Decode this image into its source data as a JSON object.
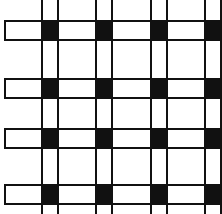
{
  "figure": {
    "width": 222,
    "height": 214,
    "background_color": "#ffffff",
    "stroke_color": "#111111",
    "fill_color": "#111111",
    "band_fill": "#ffffff",
    "stroke_width": 2
  },
  "chart_data": {
    "type": "heatmap",
    "xlabel": "",
    "ylabel": "",
    "grid": true,
    "legend_position": "none",
    "columns": [
      "V1",
      "V2",
      "V3",
      "V4"
    ],
    "rows": [
      "H1",
      "H2",
      "H3",
      "H4"
    ],
    "cell_values": [
      [
        1,
        1,
        1,
        1
      ],
      [
        1,
        1,
        1,
        1
      ],
      [
        1,
        1,
        1,
        1
      ],
      [
        1,
        1,
        1,
        1
      ]
    ],
    "value_legend": {
      "1": "black intersection square",
      "0": "white cell"
    },
    "horizontal_bands": [
      {
        "name": "H1",
        "x": 4,
        "y": 20,
        "width": 218,
        "height": 21,
        "clipped_right": true
      },
      {
        "name": "H2",
        "x": 4,
        "y": 78,
        "width": 218,
        "height": 21,
        "clipped_right": true
      },
      {
        "name": "H3",
        "x": 4,
        "y": 128,
        "width": 218,
        "height": 21,
        "clipped_right": true
      },
      {
        "name": "H4",
        "x": 4,
        "y": 184,
        "width": 218,
        "height": 21,
        "clipped_right": true
      }
    ],
    "vertical_strips": [
      {
        "name": "V1",
        "x": 41,
        "y": 0,
        "width": 18,
        "height": 214,
        "clipped_top": true,
        "clipped_bottom": true
      },
      {
        "name": "V2",
        "x": 95,
        "y": 0,
        "width": 18,
        "height": 214,
        "clipped_top": true,
        "clipped_bottom": true
      },
      {
        "name": "V3",
        "x": 150,
        "y": 0,
        "width": 18,
        "height": 214,
        "clipped_top": true,
        "clipped_bottom": true
      },
      {
        "name": "V4",
        "x": 204,
        "y": 0,
        "width": 18,
        "height": 214,
        "clipped_top": true,
        "clipped_bottom": true
      }
    ],
    "intersections": [
      {
        "row": "H1",
        "col": "V1",
        "x": 41,
        "y": 20,
        "width": 18,
        "height": 21,
        "color": "#111111"
      },
      {
        "row": "H1",
        "col": "V2",
        "x": 95,
        "y": 20,
        "width": 18,
        "height": 21,
        "color": "#111111"
      },
      {
        "row": "H1",
        "col": "V3",
        "x": 150,
        "y": 20,
        "width": 18,
        "height": 21,
        "color": "#111111"
      },
      {
        "row": "H1",
        "col": "V4",
        "x": 204,
        "y": 20,
        "width": 18,
        "height": 21,
        "color": "#111111"
      },
      {
        "row": "H2",
        "col": "V1",
        "x": 41,
        "y": 78,
        "width": 18,
        "height": 21,
        "color": "#111111"
      },
      {
        "row": "H2",
        "col": "V2",
        "x": 95,
        "y": 78,
        "width": 18,
        "height": 21,
        "color": "#111111"
      },
      {
        "row": "H2",
        "col": "V3",
        "x": 150,
        "y": 78,
        "width": 18,
        "height": 21,
        "color": "#111111"
      },
      {
        "row": "H2",
        "col": "V4",
        "x": 204,
        "y": 78,
        "width": 18,
        "height": 21,
        "color": "#111111"
      },
      {
        "row": "H3",
        "col": "V1",
        "x": 41,
        "y": 128,
        "width": 18,
        "height": 21,
        "color": "#111111"
      },
      {
        "row": "H3",
        "col": "V2",
        "x": 95,
        "y": 128,
        "width": 18,
        "height": 21,
        "color": "#111111"
      },
      {
        "row": "H3",
        "col": "V3",
        "x": 150,
        "y": 128,
        "width": 18,
        "height": 21,
        "color": "#111111"
      },
      {
        "row": "H3",
        "col": "V4",
        "x": 204,
        "y": 128,
        "width": 18,
        "height": 21,
        "color": "#111111"
      },
      {
        "row": "H4",
        "col": "V1",
        "x": 41,
        "y": 184,
        "width": 18,
        "height": 21,
        "color": "#111111"
      },
      {
        "row": "H4",
        "col": "V2",
        "x": 95,
        "y": 184,
        "width": 18,
        "height": 21,
        "color": "#111111"
      },
      {
        "row": "H4",
        "col": "V3",
        "x": 150,
        "y": 184,
        "width": 18,
        "height": 21,
        "color": "#111111"
      },
      {
        "row": "H4",
        "col": "V4",
        "x": 204,
        "y": 184,
        "width": 18,
        "height": 21,
        "color": "#111111"
      }
    ]
  }
}
